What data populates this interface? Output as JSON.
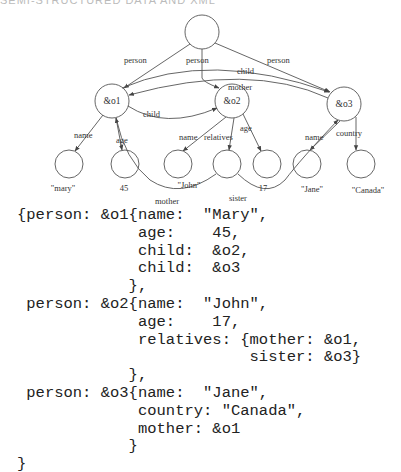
{
  "header": {
    "text": "SEMI-STRUCTURED DATA AND XML"
  },
  "graph": {
    "nodes": {
      "o1": "&o1",
      "o2": "&o2",
      "o3": "&o3"
    },
    "edge_labels": {
      "root_o1": "person",
      "root_o2": "person",
      "root_o3": "person",
      "o1_o3_child": "child",
      "o3_o1_mother": "mother",
      "o1_o2_child": "child",
      "o1_name": "name",
      "o1_age": "age",
      "o2_name": "name",
      "o2_relatives": "relatives",
      "o2_age": "age",
      "o3_name": "name",
      "o3_country": "country",
      "rel_mother": "mother",
      "rel_sister": "sister"
    },
    "leaf_values": {
      "mary": "\"mary\"",
      "age45": "45",
      "john": "\"John\"",
      "age17": "17",
      "jane": "\"Jane\"",
      "canada": "\"Canada\""
    }
  },
  "code": {
    "lines": [
      "{person: &o1{name:  \"Mary\",",
      "             age:    45,",
      "             child:  &o2,",
      "             child:  &o3",
      "            },",
      " person: &o2{name:  \"John\",",
      "             age:    17,",
      "             relatives: {mother: &o1,",
      "                         sister: &o3}",
      "            },",
      " person: &o3{name:  \"Jane\",",
      "             country: \"Canada\",",
      "             mother: &o1",
      "            }",
      "}"
    ]
  }
}
